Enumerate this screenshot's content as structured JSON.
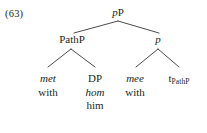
{
  "figure": {
    "example_number": "(63)",
    "type": "syntactic-tree",
    "language_note": "Dutch example with English gloss",
    "text_color": "#231f20",
    "background_color": "#ffffff",
    "branch_color": "#3a3538"
  },
  "tree": {
    "root": {
      "label_italic": "p",
      "label_roman": "P",
      "full_label": "pP"
    },
    "level2": {
      "left": {
        "label_italic": "",
        "label_roman": "PathP",
        "full_label": "PathP"
      },
      "right": {
        "label_italic": "p",
        "label_roman": "",
        "full_label": "p"
      }
    },
    "leaves": [
      {
        "name": "met",
        "lines": [
          {
            "text": "met",
            "style": "italic"
          },
          {
            "text": "with",
            "style": "roman"
          }
        ]
      },
      {
        "name": "dp",
        "lines": [
          {
            "text": "DP",
            "style": "roman"
          },
          {
            "text": "hom",
            "style": "italic"
          },
          {
            "text": "him",
            "style": "roman"
          }
        ]
      },
      {
        "name": "mee",
        "lines": [
          {
            "text": "mee",
            "style": "italic"
          },
          {
            "text": "with",
            "style": "roman"
          }
        ]
      },
      {
        "name": "trace",
        "lines": [
          {
            "text": "t",
            "style": "roman",
            "subscript": "PathP"
          }
        ]
      }
    ]
  }
}
